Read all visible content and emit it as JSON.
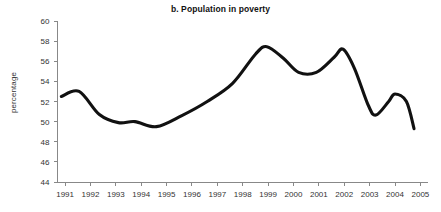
{
  "chart_data": {
    "type": "line",
    "title": "b. Population in poverty",
    "xlabel": "",
    "ylabel": "percentage",
    "grid": false,
    "legend": false,
    "xlim": [
      1990.7,
      2005.3
    ],
    "ylim": [
      44,
      60
    ],
    "yticks": [
      44,
      46,
      48,
      50,
      52,
      54,
      56,
      58,
      60
    ],
    "ytick_labels": [
      "44",
      "46",
      "48",
      "50",
      "52",
      "54",
      "56",
      "58",
      "60"
    ],
    "categories": [
      "1991",
      "1992",
      "1993",
      "1994",
      "1995",
      "1996",
      "1997",
      "1998",
      "1999",
      "2000",
      "2001",
      "2002",
      "2003",
      "2004",
      "2005"
    ],
    "x": [
      1991,
      1992,
      1993,
      1994,
      1995,
      1996,
      1997,
      1998,
      1999,
      2000,
      2001,
      2002,
      2003,
      2004,
      2005
    ],
    "series": [
      {
        "name": "Population in poverty",
        "color": "#111111",
        "values": [
          52.5,
          53.0,
          50.0,
          49.9,
          49.5,
          51.2,
          53.3,
          55.6,
          57.4,
          54.9,
          55.3,
          57.1,
          50.8,
          52.7,
          49.3
        ]
      }
    ],
    "anchor_points": [
      {
        "x": 1990.85,
        "y": 52.5
      },
      {
        "x": 1991.55,
        "y": 53.0
      },
      {
        "x": 1992.35,
        "y": 50.7
      },
      {
        "x": 1993.1,
        "y": 49.9
      },
      {
        "x": 1993.75,
        "y": 50.0
      },
      {
        "x": 1994.6,
        "y": 49.5
      },
      {
        "x": 1995.6,
        "y": 50.6
      },
      {
        "x": 1996.6,
        "y": 52.0
      },
      {
        "x": 1997.6,
        "y": 53.8
      },
      {
        "x": 1998.5,
        "y": 56.7
      },
      {
        "x": 1998.95,
        "y": 57.45
      },
      {
        "x": 1999.6,
        "y": 56.3
      },
      {
        "x": 2000.2,
        "y": 54.9
      },
      {
        "x": 2000.9,
        "y": 54.9
      },
      {
        "x": 2001.6,
        "y": 56.4
      },
      {
        "x": 2001.95,
        "y": 57.2
      },
      {
        "x": 2002.4,
        "y": 55.3
      },
      {
        "x": 2002.95,
        "y": 51.6
      },
      {
        "x": 2003.25,
        "y": 50.65
      },
      {
        "x": 2003.75,
        "y": 52.0
      },
      {
        "x": 2004.0,
        "y": 52.75
      },
      {
        "x": 2004.45,
        "y": 52.0
      },
      {
        "x": 2004.75,
        "y": 49.3
      }
    ]
  },
  "axes": {
    "y_axis_title": "percentage"
  }
}
